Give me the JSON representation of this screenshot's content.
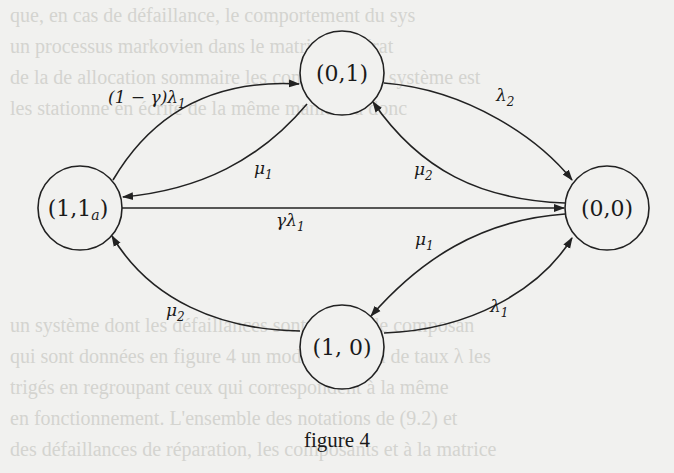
{
  "figure": {
    "caption": "figure 4",
    "nodes": [
      {
        "id": "n01",
        "label": "(0,1)"
      },
      {
        "id": "n11a",
        "label": "(1,1a)",
        "main": "(1,1",
        "sub": "a",
        "close": ")"
      },
      {
        "id": "n00",
        "label": "(0,0)"
      },
      {
        "id": "n10",
        "label": "(1, 0)"
      }
    ],
    "edges": [
      {
        "from": "(1,1a)",
        "to": "(0,1)",
        "label": "(1 − γ)λ1",
        "text": "(1 − γ)λ",
        "sub": "1"
      },
      {
        "from": "(0,1)",
        "to": "(1,1a)",
        "label": "μ1",
        "text": "μ",
        "sub": "1"
      },
      {
        "from": "(0,1)",
        "to": "(0,0)",
        "label": "λ2",
        "text": "λ",
        "sub": "2"
      },
      {
        "from": "(0,0)",
        "to": "(0,1)",
        "label": "μ2",
        "text": "μ",
        "sub": "2"
      },
      {
        "from": "(1,1a)",
        "to": "(0,0)",
        "label": "γλ1",
        "text": "γλ",
        "sub": "1"
      },
      {
        "from": "(0,0)",
        "to": "(1,0)",
        "label": "μ1",
        "text": "μ",
        "sub": "1"
      },
      {
        "from": "(1,0)",
        "to": "(0,0)",
        "label": "λ1",
        "text": "λ",
        "sub": "1"
      },
      {
        "from": "(1,0)",
        "to": "(1,1a)",
        "label": "μ2",
        "text": "μ",
        "sub": "2"
      }
    ]
  },
  "background_text": [
    "que, en cas de défaillance, le comportement du sys",
    "un processus markovien dans le matrice générat",
    "de la de allocation sommaire les composant du système est",
    "les stationne en écrite de la même manière a donc",
    "",
    "",
    "",
    "",
    "",
    "",
    "un système dont les défaillances sont dû à la de composan",
    "qui sont données en figure 4 un mode commun de taux λ les",
    "trigés en regroupant ceux qui correspondent à la même",
    "en fonctionnement. L'ensemble des notations de (9.2) et",
    "des défaillances de réparation, les composants et à la matrice"
  ]
}
